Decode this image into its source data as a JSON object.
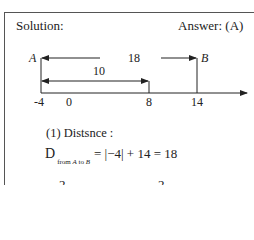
{
  "header": {
    "solution_label": "Solution:",
    "answer_label": "Answer: (A)"
  },
  "diagram": {
    "point_a_label": "A",
    "point_b_label": "B",
    "distance_ab_label": "18",
    "distance_a_to_8_label": "10",
    "ticks": [
      "-4",
      "0",
      "8",
      "14"
    ]
  },
  "solution": {
    "step_label": "(1) Distsnce :",
    "formula": {
      "symbol": "D",
      "subscript_from": "from",
      "subscript_a": "A",
      "subscript_to": "to",
      "subscript_b": "B",
      "rhs": "= |−4| + 14 = 18"
    },
    "partial_next_line": [
      "2",
      "2"
    ]
  }
}
